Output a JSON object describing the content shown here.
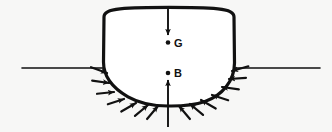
{
  "figure": {
    "type": "naval-architecture-diagram",
    "background_color": "#f7f7f6",
    "ink_color": "#111111"
  },
  "labels": {
    "centre_of_gravity": "G",
    "centre_of_buoyancy": "B"
  },
  "points": {
    "G": {
      "x": 168,
      "y": 42
    },
    "B": {
      "x": 168,
      "y": 73
    }
  },
  "waterline": {
    "name": "waterline",
    "y": 68,
    "left_start_x": 22,
    "left_end_x": 108,
    "right_start_x": 230,
    "right_end_x": 320,
    "stroke_width": 1.6
  },
  "hull": {
    "name": "hull-section",
    "deck_left_x": 104,
    "deck_right_x": 233,
    "deck_y": 13,
    "deck_camber_peak_y": 8,
    "keel_x": 168,
    "keel_y": 106,
    "stroke_width": 3.2,
    "path": "M 104 17 C 104 13 108 10 120 9 C 142 7 196 7 218 9 C 230 10 233 13 233 17 L 234 64 C 234 82 222 96 205 102 C 190 107 178 106 168 106 C 156 106 142 105 128 97 C 112 88 104 76 104 62 Z"
  },
  "weight_arrow": {
    "name": "weight-force-arrow",
    "description": "downward arrow through G representing gravity / weight",
    "x": 168,
    "from_y": 10,
    "to_y": 38,
    "direction": "down"
  },
  "buoyancy_arrow": {
    "name": "buoyancy-force-arrow",
    "description": "upward arrow through B representing buoyant force",
    "x": 168,
    "from_y": 126,
    "to_y": 78,
    "direction": "up"
  },
  "pressure_arrows": {
    "name": "hydrostatic-pressure-arrows",
    "description": "arrows normal to the wetted hull surface pointing inward",
    "count": 14,
    "length": 17,
    "stroke_width": 2.2,
    "items": [
      {
        "tip_x": 107,
        "tip_y": 73,
        "angle_deg": -20
      },
      {
        "tip_x": 109,
        "tip_y": 83,
        "angle_deg": -8
      },
      {
        "tip_x": 114,
        "tip_y": 92,
        "angle_deg": 6
      },
      {
        "tip_x": 124,
        "tip_y": 99,
        "angle_deg": 18
      },
      {
        "tip_x": 136,
        "tip_y": 103,
        "angle_deg": 30
      },
      {
        "tip_x": 148,
        "tip_y": 105,
        "angle_deg": 40
      },
      {
        "tip_x": 158,
        "tip_y": 106,
        "angle_deg": 50
      },
      {
        "tip_x": 179,
        "tip_y": 106,
        "angle_deg": 130
      },
      {
        "tip_x": 190,
        "tip_y": 104,
        "angle_deg": 140
      },
      {
        "tip_x": 201,
        "tip_y": 100,
        "angle_deg": 150
      },
      {
        "tip_x": 212,
        "tip_y": 95,
        "angle_deg": 162
      },
      {
        "tip_x": 222,
        "tip_y": 87,
        "angle_deg": 172
      },
      {
        "tip_x": 229,
        "tip_y": 79,
        "angle_deg": 184
      },
      {
        "tip_x": 232,
        "tip_y": 71,
        "angle_deg": 196
      }
    ]
  }
}
